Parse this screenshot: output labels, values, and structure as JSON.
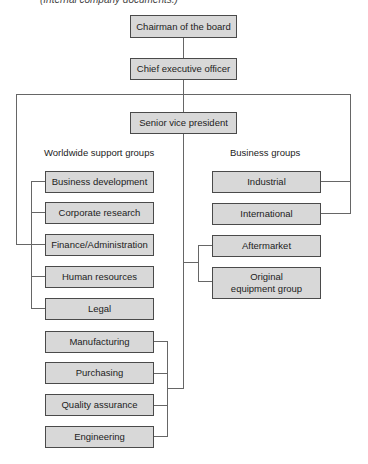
{
  "caption": "(Internal company documents.)",
  "top": {
    "chairman": "Chairman of the board",
    "ceo": "Chief executive officer",
    "svp": "Senior vice president"
  },
  "headers": {
    "support": "Worldwide support groups",
    "business": "Business groups"
  },
  "support_groups": [
    "Business development",
    "Corporate research",
    "Finance/Administration",
    "Human resources",
    "Legal"
  ],
  "operations_groups": [
    "Manufacturing",
    "Purchasing",
    "Quality assurance",
    "Engineering"
  ],
  "business_groups_ceo": [
    "Industrial",
    "International"
  ],
  "business_groups_svp": [
    "Aftermarket",
    "Original equipment group"
  ],
  "colors": {
    "box_fill": "#d8d8d8",
    "box_border": "#4a4a4a",
    "line": "#666666"
  }
}
